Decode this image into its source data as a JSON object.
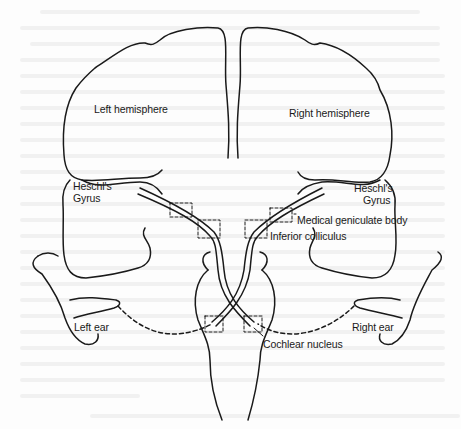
{
  "figure": {
    "type": "anatomical diagram",
    "line_color": "#1a1a1a",
    "background_color": "#fdfdfd"
  },
  "labels": {
    "left_hemisphere": "Left hemisphere",
    "right_hemisphere": "Right hemisphere",
    "left_heschls": "Heschl's",
    "left_gyrus": "Gyrus",
    "right_heschls": "Heschl's",
    "right_gyrus": "Gyrus",
    "medial_geniculate_body": "Medical geniculate body",
    "inferior_colliculus": "Inferior colliculus",
    "left_ear": "Left ear",
    "right_ear": "Right ear",
    "cochlear_nucleus": "Cochlear nucleus"
  },
  "structures": [
    {
      "name": "left-hemisphere",
      "kind": "cortex"
    },
    {
      "name": "right-hemisphere",
      "kind": "cortex"
    },
    {
      "name": "left-temporal-lobe",
      "kind": "cortex",
      "contains": "Heschl's Gyrus"
    },
    {
      "name": "right-temporal-lobe",
      "kind": "cortex",
      "contains": "Heschl's Gyrus"
    },
    {
      "name": "medial-geniculate-body",
      "kind": "nucleus",
      "marker": "dashed-box"
    },
    {
      "name": "inferior-colliculus",
      "kind": "nucleus",
      "marker": "dashed-box"
    },
    {
      "name": "cochlear-nucleus",
      "kind": "nucleus",
      "marker": "dashed-box"
    },
    {
      "name": "brainstem",
      "kind": "outline"
    }
  ],
  "connections": [
    {
      "from": "Left ear",
      "to": "Cochlear nucleus (left)",
      "style": "dashed"
    },
    {
      "from": "Right ear",
      "to": "Cochlear nucleus (right)",
      "style": "dashed"
    },
    {
      "from": "Cochlear nucleus (left)",
      "to": "Right hemisphere Heschl's Gyrus",
      "style": "solid",
      "crossing": true
    },
    {
      "from": "Cochlear nucleus (right)",
      "to": "Left hemisphere Heschl's Gyrus",
      "style": "solid",
      "crossing": true
    }
  ]
}
